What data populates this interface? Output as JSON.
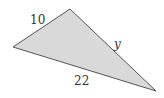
{
  "diagram": {
    "type": "triangle",
    "fill_color": "#d9d9d9",
    "stroke_color": "#555555",
    "vertices": {
      "top": [
        70,
        9
      ],
      "left": [
        13,
        47
      ],
      "right": [
        156,
        91
      ]
    },
    "sides": [
      {
        "name": "left-top",
        "label": "10",
        "position": [
          30,
          24
        ]
      },
      {
        "name": "top-right",
        "label": "y",
        "position": [
          114,
          48
        ]
      },
      {
        "name": "left-right",
        "label": "22",
        "position": [
          74,
          85
        ]
      }
    ]
  }
}
